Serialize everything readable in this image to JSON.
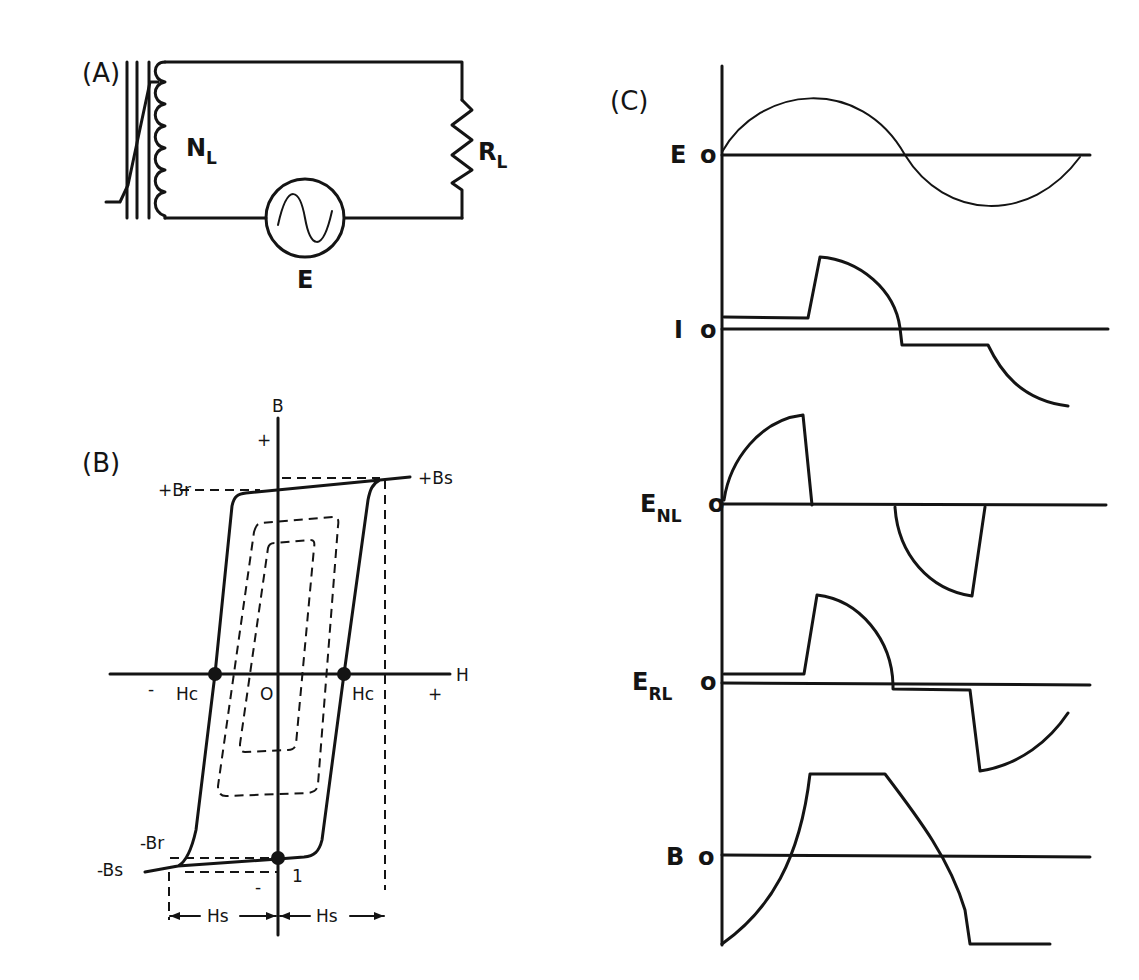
{
  "panels": {
    "a": {
      "label": "(A)",
      "winding_label": "N",
      "winding_sub": "L",
      "resistor_label": "R",
      "resistor_sub": "L",
      "source_label": "E",
      "components": [
        "saturable-core",
        "load-winding-NL",
        "load-resistor-RL",
        "ac-source-E"
      ]
    },
    "b": {
      "label": "(B)",
      "y_axis_label": "B",
      "x_axis_label": "H",
      "plus_y": "+",
      "plus_x": "+",
      "minus_x": "-",
      "minus_y": "-",
      "origin": "O",
      "pos_remanence": "+Br",
      "neg_remanence": "-Br",
      "pos_saturation": "+Bs",
      "neg_saturation": "-Bs",
      "coercive_left": "Hc",
      "coercive_right": "Hc",
      "saturation_field_left": "Hs",
      "saturation_field_right": "Hs",
      "point_marker": "1"
    },
    "c": {
      "label": "(C)",
      "traces": [
        {
          "name": "E",
          "sub": "",
          "zero": "o"
        },
        {
          "name": "I",
          "sub": "",
          "zero": "o"
        },
        {
          "name": "E",
          "sub": "NL",
          "zero": "o"
        },
        {
          "name": "E",
          "sub": "RL",
          "zero": "o"
        },
        {
          "name": "B",
          "sub": "",
          "zero": "o"
        }
      ]
    }
  },
  "colors": {
    "ink": "#141414",
    "paper": "#ffffff"
  }
}
